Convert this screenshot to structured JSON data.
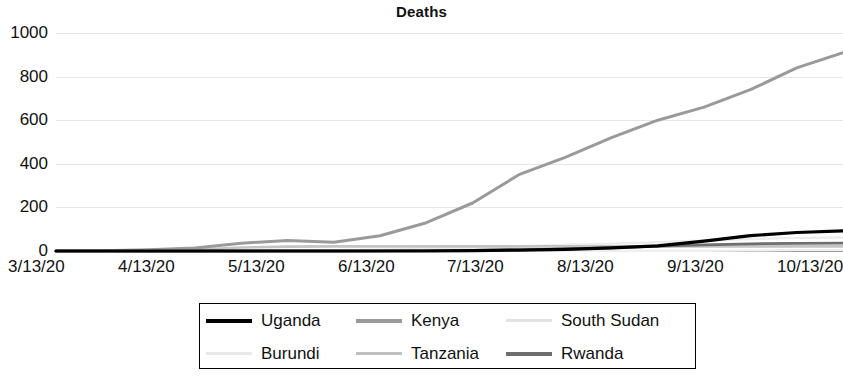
{
  "chart_data": {
    "type": "line",
    "title": "Deaths",
    "xlabel": "",
    "ylabel": "",
    "ylim": [
      0,
      1000
    ],
    "yticks": [
      0,
      200,
      400,
      600,
      800,
      1000
    ],
    "grid": true,
    "legend_position": "bottom",
    "x_tick_labels": [
      "3/13/20",
      "4/13/20",
      "5/13/20",
      "6/13/20",
      "7/13/20",
      "8/13/20",
      "9/13/20",
      "10/13/20"
    ],
    "x": [
      "3/13/20",
      "3/28/20",
      "4/12/20",
      "4/27/20",
      "5/12/20",
      "5/20/20",
      "5/27/20",
      "6/11/20",
      "6/26/20",
      "7/11/20",
      "7/26/20",
      "8/10/20",
      "8/25/20",
      "9/9/20",
      "9/24/20",
      "10/9/20",
      "10/24/20",
      "11/2/20"
    ],
    "series": [
      {
        "name": "Uganda",
        "color": "#000000",
        "width": 3.2,
        "values": [
          0,
          0,
          0,
          0,
          0,
          0,
          0,
          0,
          0,
          2,
          4,
          8,
          14,
          24,
          45,
          70,
          85,
          92
        ]
      },
      {
        "name": "Kenya",
        "color": "#9a9a9a",
        "width": 3.0,
        "values": [
          0,
          1,
          6,
          14,
          36,
          48,
          40,
          70,
          130,
          220,
          350,
          430,
          520,
          600,
          660,
          740,
          840,
          910
        ]
      },
      {
        "name": "South Sudan",
        "color": "#ececec",
        "width": 2.4,
        "values": [
          0,
          0,
          0,
          0,
          0,
          1,
          2,
          6,
          10,
          16,
          22,
          28,
          34,
          40,
          48,
          55,
          60,
          62
        ]
      },
      {
        "name": "Burundi",
        "color": "#efefef",
        "width": 2.4,
        "values": [
          0,
          0,
          0,
          0,
          0,
          0,
          0,
          1,
          1,
          1,
          1,
          1,
          1,
          1,
          1,
          2,
          3,
          3
        ]
      },
      {
        "name": "Tanzania",
        "color": "#c4c4c4",
        "width": 2.6,
        "values": [
          0,
          0,
          0,
          5,
          16,
          20,
          21,
          21,
          21,
          21,
          21,
          21,
          21,
          21,
          21,
          21,
          21,
          21
        ]
      },
      {
        "name": "Rwanda",
        "color": "#6e6e6e",
        "width": 2.8,
        "values": [
          0,
          0,
          0,
          0,
          0,
          0,
          0,
          1,
          2,
          3,
          5,
          9,
          14,
          22,
          28,
          33,
          35,
          36
        ]
      }
    ]
  },
  "legend": {
    "items": [
      {
        "label": "Uganda",
        "swatch_color": "#000000",
        "swatch_height": 4
      },
      {
        "label": "Kenya",
        "swatch_color": "#9a9a9a",
        "swatch_height": 4
      },
      {
        "label": "South Sudan",
        "swatch_color": "#e2e2e2",
        "swatch_height": 3
      },
      {
        "label": "Burundi",
        "swatch_color": "#e8e8e8",
        "swatch_height": 3
      },
      {
        "label": "Tanzania",
        "swatch_color": "#c0c0c0",
        "swatch_height": 3
      },
      {
        "label": "Rwanda",
        "swatch_color": "#6e6e6e",
        "swatch_height": 4
      }
    ]
  }
}
